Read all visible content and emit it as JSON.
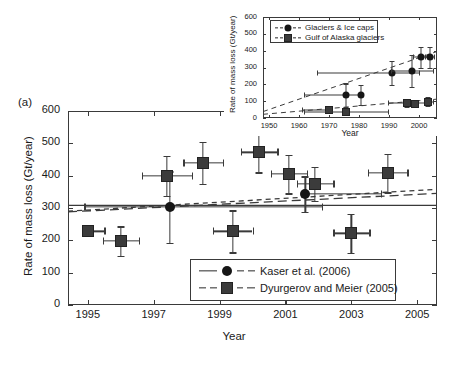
{
  "figure": {
    "panel_label": "(a)",
    "background": "#ffffff",
    "marker_color": "#3b3b3b",
    "axis_color": "#3a3a3a"
  },
  "main": {
    "xlabel": "Year",
    "ylabel": "Rate of mass loss (Gt/year)",
    "xticks": [
      "1995",
      "1997",
      "1999",
      "2001",
      "2003",
      "2005"
    ],
    "yticks": [
      "0",
      "100",
      "200",
      "300",
      "400",
      "500",
      "600"
    ],
    "legend": {
      "entries": [
        {
          "label": "Kaser et al. (2006)",
          "marker": "circle",
          "line": "solid"
        },
        {
          "label": "Dyurgerov and Meier (2005)",
          "marker": "square",
          "line": "dashed"
        }
      ]
    }
  },
  "inset": {
    "xlabel": "Year",
    "ylabel": "Rate of mass loss (Gt/year)",
    "xticks": [
      "1950",
      "1960",
      "1970",
      "1980",
      "1990",
      "2000"
    ],
    "yticks": [
      "0",
      "100",
      "200",
      "300",
      "400",
      "500",
      "600"
    ],
    "legend": {
      "entries": [
        {
          "label": "Glaciers & Ice caps",
          "marker": "circle",
          "line": "dashed"
        },
        {
          "label": "Gulf of Alaska glaciers",
          "marker": "square",
          "line": "dashed"
        }
      ]
    }
  },
  "chart_data": [
    {
      "id": "main-panel-a",
      "type": "scatter",
      "title": "",
      "panel": "(a)",
      "xlabel": "Year",
      "ylabel": "Rate of mass loss (Gt/year)",
      "xlim": [
        1994.4,
        2005.6
      ],
      "ylim": [
        0,
        600
      ],
      "xticks": [
        1995,
        1997,
        1999,
        2001,
        2003,
        2005
      ],
      "yticks": [
        0,
        100,
        200,
        300,
        400,
        500,
        600
      ],
      "grid": false,
      "legend_position": "lower-center-right",
      "series": [
        {
          "name": "Kaser et al. (2006)",
          "marker": "circle",
          "line": "solid",
          "points": [
            {
              "x": 1997.5,
              "y": 303,
              "yerr": [
                110,
                110
              ],
              "xerr": [
                2.6,
                4.6
              ]
            },
            {
              "x": 2001.6,
              "y": 343,
              "yerr": [
                55,
                55
              ],
              "xerr": [
                0.0,
                2.3
              ]
            }
          ]
        },
        {
          "name": "Dyurgerov and Meier (2005)",
          "marker": "square",
          "line": "dashed",
          "points": [
            {
              "x": 1995.0,
              "y": 228,
              "yerr": [
                0,
                0
              ],
              "xerr": [
                0.0,
                0.5
              ]
            },
            {
              "x": 1996.0,
              "y": 198,
              "yerr": [
                45,
                45
              ],
              "xerr": [
                0.55,
                0.55
              ]
            },
            {
              "x": 1997.4,
              "y": 400,
              "yerr": [
                62,
                62
              ],
              "xerr": [
                0.75,
                0.75
              ]
            },
            {
              "x": 1998.5,
              "y": 440,
              "yerr": [
                65,
                65
              ],
              "xerr": [
                0.6,
                0.6
              ]
            },
            {
              "x": 1999.4,
              "y": 228,
              "yerr": [
                65,
                65
              ],
              "xerr": [
                0.6,
                0.6
              ]
            },
            {
              "x": 2000.2,
              "y": 472,
              "yerr": [
                62,
                62
              ],
              "xerr": [
                0.55,
                0.55
              ]
            },
            {
              "x": 2001.1,
              "y": 405,
              "yerr": [
                60,
                60
              ],
              "xerr": [
                0.55,
                0.55
              ]
            },
            {
              "x": 2001.9,
              "y": 375,
              "yerr": [
                52,
                52
              ],
              "xerr": [
                0.55,
                0.55
              ]
            },
            {
              "x": 2003.0,
              "y": 222,
              "yerr": [
                60,
                60
              ],
              "xerr": [
                0.55,
                0.55
              ]
            },
            {
              "x": 2004.1,
              "y": 408,
              "yerr": [
                60,
                60
              ],
              "xerr": [
                0.6,
                0.6
              ]
            }
          ]
        }
      ],
      "trend_lines": [
        {
          "name": "Kaser trend",
          "style": "solid",
          "x": [
            1994.4,
            2005.6
          ],
          "y": [
            308,
            308
          ]
        },
        {
          "name": "Kaser long-dash trend",
          "style": "long-dash",
          "x": [
            1994.4,
            2005.6
          ],
          "y": [
            288,
            345
          ]
        },
        {
          "name": "Dyurgerov trend",
          "style": "dashed",
          "x": [
            1994.4,
            2005.6
          ],
          "y": [
            290,
            358
          ]
        }
      ]
    },
    {
      "id": "inset-panel",
      "type": "scatter",
      "title": "",
      "xlabel": "Year",
      "ylabel": "Rate of mass loss (Gt/year)",
      "xlim": [
        1948,
        2006
      ],
      "ylim": [
        0,
        600
      ],
      "xticks": [
        1950,
        1960,
        1970,
        1980,
        1990,
        2000
      ],
      "yticks": [
        0,
        100,
        200,
        300,
        400,
        500,
        600
      ],
      "grid": false,
      "legend_position": "upper-left",
      "series": [
        {
          "name": "Glaciers & Ice caps",
          "marker": "circle",
          "line": "dashed",
          "points": [
            {
              "x": 1975.5,
              "y": 135,
              "yerr": [
                70,
                70
              ],
              "xerr": [
                14.0,
                5.0
              ]
            },
            {
              "x": 1980.5,
              "y": 137,
              "yerr": [
                62,
                62
              ],
              "xerr": [
                0.5,
                0.5
              ]
            },
            {
              "x": 1991.0,
              "y": 268,
              "yerr": [
                70,
                70
              ],
              "xerr": [
                25.0,
                9.0
              ]
            },
            {
              "x": 1997.5,
              "y": 278,
              "yerr": [
                95,
                95
              ],
              "xerr": [
                7.0,
                7.0
              ]
            },
            {
              "x": 2000.5,
              "y": 360,
              "yerr": [
                62,
                62
              ],
              "xerr": [
                2.5,
                2.5
              ]
            },
            {
              "x": 2003.5,
              "y": 360,
              "yerr": [
                62,
                62
              ],
              "xerr": [
                1.5,
                1.5
              ]
            }
          ]
        },
        {
          "name": "Gulf of Alaska glaciers",
          "marker": "square",
          "line": "dashed",
          "points": [
            {
              "x": 1970.0,
              "y": 48,
              "yerr": [
                18,
                18
              ],
              "xerr": [
                9.0,
                0.5
              ]
            },
            {
              "x": 1975.5,
              "y": 35,
              "yerr": [
                18,
                18
              ],
              "xerr": [
                14.0,
                14.0
              ]
            },
            {
              "x": 1996.0,
              "y": 88,
              "yerr": [
                22,
                22
              ],
              "xerr": [
                6.5,
                6.5
              ]
            },
            {
              "x": 1998.5,
              "y": 85,
              "yerr": [
                20,
                20
              ],
              "xerr": [
                0.5,
                0.5
              ]
            },
            {
              "x": 2003.0,
              "y": 98,
              "yerr": [
                25,
                25
              ],
              "xerr": [
                1.5,
                1.5
              ]
            }
          ]
        }
      ],
      "trend_lines": [
        {
          "name": "Glaciers & Ice caps trend",
          "style": "dashed",
          "x": [
            1948,
            2006
          ],
          "y": [
            38,
            395
          ]
        },
        {
          "name": "Gulf of Alaska trend",
          "style": "dashed",
          "x": [
            1948,
            2006
          ],
          "y": [
            22,
            112
          ]
        }
      ]
    }
  ]
}
